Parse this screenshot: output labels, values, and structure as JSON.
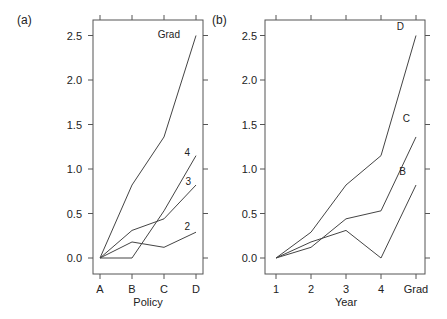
{
  "chart_data": [
    {
      "type": "line",
      "panel_label": "(a)",
      "title": "",
      "xlabel": "Policy",
      "ylabel": "",
      "categories": [
        "A",
        "B",
        "C",
        "D"
      ],
      "yticks": [
        "0.0",
        "0.5",
        "1.0",
        "1.5",
        "2.0",
        "2.5"
      ],
      "ylim": [
        -0.18,
        2.7
      ],
      "grid": false,
      "legend": "inline labels at line ends",
      "series": [
        {
          "name": "Grad",
          "values": [
            0.0,
            0.82,
            1.36,
            2.5
          ]
        },
        {
          "name": "4",
          "values": [
            0.0,
            0.0,
            0.53,
            1.15
          ]
        },
        {
          "name": "3",
          "values": [
            0.0,
            0.31,
            0.44,
            0.82
          ]
        },
        {
          "name": "2",
          "values": [
            0.0,
            0.18,
            0.12,
            0.29
          ]
        }
      ]
    },
    {
      "type": "line",
      "panel_label": "(b)",
      "title": "",
      "xlabel": "Year",
      "ylabel": "",
      "categories": [
        "1",
        "2",
        "3",
        "4",
        "Grad"
      ],
      "yticks": [
        "0.0",
        "0.5",
        "1.0",
        "1.5",
        "2.0",
        "2.5"
      ],
      "ylim": [
        -0.18,
        2.7
      ],
      "grid": false,
      "legend": "inline labels at line ends",
      "series": [
        {
          "name": "D",
          "values": [
            0.0,
            0.29,
            0.82,
            1.15,
            2.5
          ]
        },
        {
          "name": "C",
          "values": [
            0.0,
            0.12,
            0.44,
            0.53,
            1.36
          ]
        },
        {
          "name": "B",
          "values": [
            0.0,
            0.18,
            0.31,
            0.0,
            0.82
          ]
        }
      ]
    }
  ]
}
